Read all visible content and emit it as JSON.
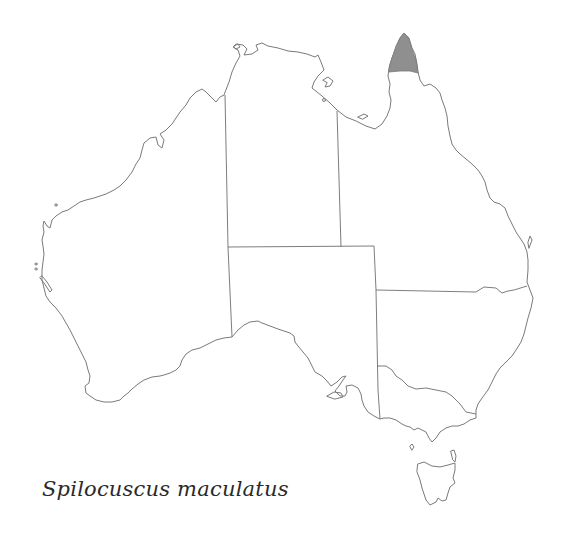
{
  "map": {
    "title": "Spilocuscus maculatus",
    "subject": "Australia distribution map",
    "highlighted_region": "Cape York Peninsula (northern Queensland)",
    "colors": {
      "background": "#ffffff",
      "outline": "#7a7a7a",
      "range_fill": "#8f8f8f",
      "caption_text": "#2a2a2a"
    },
    "states": [
      "WA",
      "NT",
      "SA",
      "QLD",
      "NSW",
      "VIC",
      "TAS"
    ]
  }
}
